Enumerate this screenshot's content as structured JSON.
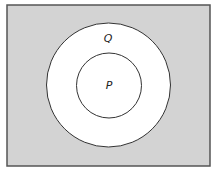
{
  "diagram": {
    "type": "venn",
    "colors": {
      "universe_fill": "#d3d3d3",
      "universe_stroke": "#555555",
      "circle_fill": "#ffffff",
      "circle_stroke": "#333333"
    },
    "universe": {
      "x": 7,
      "y": 5,
      "width": 203,
      "height": 161
    },
    "sets": [
      {
        "label": "Q",
        "cx": 108.5,
        "cy": 85,
        "r": 62,
        "label_x": 108,
        "label_y": 42
      },
      {
        "label": "P",
        "cx": 109,
        "cy": 85.5,
        "r": 32.5,
        "label_x": 109,
        "label_y": 89
      }
    ]
  }
}
